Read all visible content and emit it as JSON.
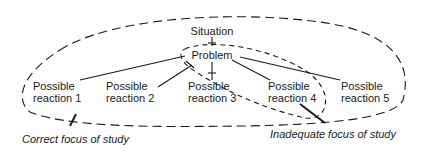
{
  "diagram": {
    "nodes": {
      "situation": "Situation",
      "problem": "Problem"
    },
    "reactions": [
      {
        "line1": "Possible",
        "line2": "reaction 1"
      },
      {
        "line1": "Possible",
        "line2": "reaction 2"
      },
      {
        "line1": "Possible",
        "line2": "reaction 3"
      },
      {
        "line1": "Possible",
        "line2": "reaction 4"
      },
      {
        "line1": "Possible",
        "line2": "reaction 5"
      }
    ],
    "captions": {
      "correct": "Correct focus of study",
      "inadequate": "Inadequate focus of study"
    },
    "colors": {
      "ink": "#1a1a1a",
      "background": "#ffffff"
    }
  }
}
